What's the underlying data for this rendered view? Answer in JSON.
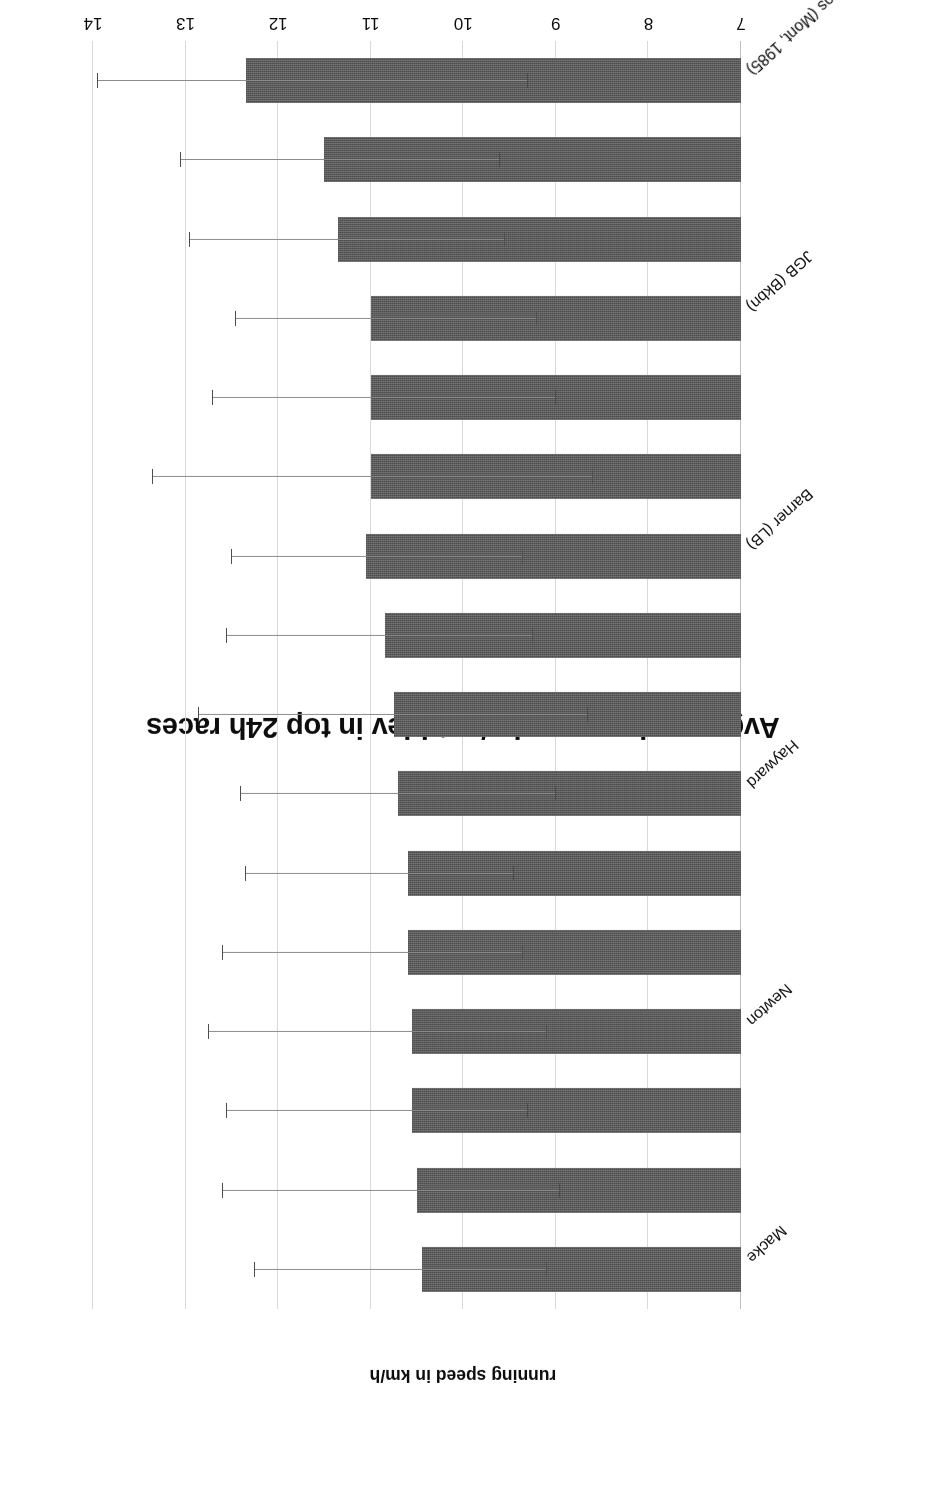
{
  "chart_data": {
    "type": "bar",
    "orientation": "horizontal-scan-rotated-180",
    "title": "Avg. running speed +/- stddev in top 24h races",
    "xlabel": "",
    "ylabel": "running speed in km/h",
    "axis_ticks": [
      "7",
      "8",
      "9",
      "10",
      "11",
      "12",
      "13",
      "14"
    ],
    "ylim": [
      7,
      14
    ],
    "grid": true,
    "legend": null,
    "bar_color": "#595959",
    "categories": [
      "Kouros (Mont, 1985)",
      "",
      "",
      "JGB (Bkbn)",
      "",
      "",
      "Barner (LB)",
      "",
      "",
      "Hayward",
      "",
      "",
      "Newton",
      "",
      "",
      "Macke"
    ],
    "visible_category_labels": [
      "Kouros (Mont, 1985)",
      "JGB (Bkbn)",
      "Barner (LB)",
      "Hayward",
      "Newton",
      "Macke"
    ],
    "values": [
      12.35,
      11.5,
      11.35,
      11.0,
      11.0,
      11.0,
      11.05,
      10.85,
      10.75,
      10.7,
      10.6,
      10.6,
      10.55,
      10.55,
      10.5,
      10.45
    ],
    "err_high": [
      13.95,
      13.05,
      12.95,
      12.45,
      12.7,
      13.35,
      12.5,
      12.55,
      12.85,
      12.4,
      12.35,
      12.6,
      12.75,
      12.55,
      12.6,
      12.25
    ],
    "err_low": [
      9.3,
      9.6,
      9.55,
      9.2,
      9.0,
      8.6,
      9.35,
      9.25,
      8.65,
      9.0,
      9.45,
      9.35,
      9.1,
      9.3,
      8.95,
      9.1
    ]
  }
}
